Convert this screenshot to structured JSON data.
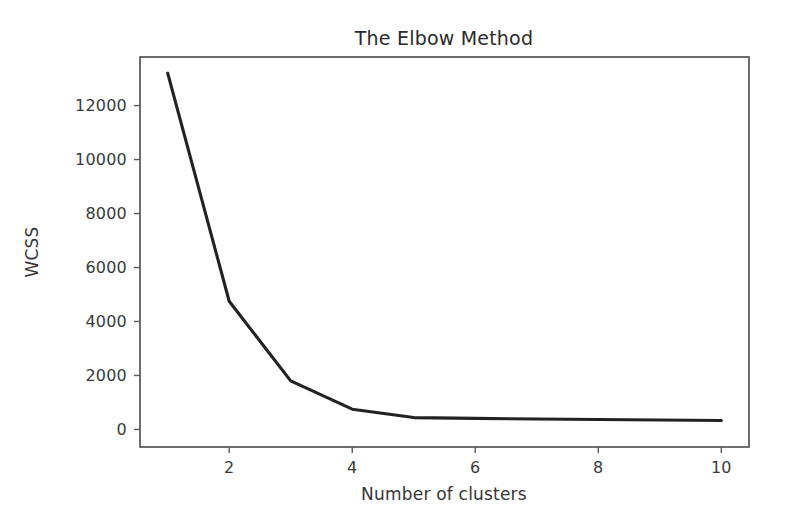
{
  "figure": {
    "background_color": "#ffffff",
    "width": 785,
    "height": 522
  },
  "chart_data": {
    "type": "line",
    "title": "The Elbow Method",
    "xlabel": "Number of clusters",
    "ylabel": "WCSS",
    "x": [
      1,
      2,
      3,
      4,
      5,
      6,
      7,
      8,
      9,
      10
    ],
    "values": [
      13200,
      4750,
      1800,
      750,
      440,
      410,
      390,
      370,
      350,
      330
    ],
    "series": [
      {
        "name": "WCSS",
        "values": [
          13200,
          4750,
          1800,
          750,
          440,
          410,
          390,
          370,
          350,
          330
        ],
        "color": "#222222",
        "line_width": 3.1
      }
    ],
    "xlim": [
      0.55,
      10.45
    ],
    "ylim": [
      -650,
      13800
    ],
    "xticks": [
      2,
      4,
      6,
      8,
      10
    ],
    "xtick_labels": [
      "2",
      "4",
      "6",
      "8",
      "10"
    ],
    "yticks": [
      0,
      2000,
      4000,
      6000,
      8000,
      10000,
      12000
    ],
    "ytick_labels": [
      "0",
      "2000",
      "4000",
      "6000",
      "8000",
      "10000",
      "12000"
    ],
    "grid": false,
    "legend": null,
    "legend_position": "none",
    "annotations": []
  },
  "axes": {
    "spine_color": "#4a4a4a",
    "tick_color": "#5a5a5a",
    "text_color": "#3a3a3a",
    "title_color": "#2b2b2b"
  }
}
